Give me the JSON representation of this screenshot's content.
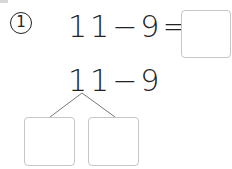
{
  "problem": {
    "number_label": "1",
    "equation": "11−9=",
    "decomposition_expression": "11−9",
    "answer_box_value": "",
    "split_left_value": "",
    "split_right_value": ""
  },
  "colors": {
    "text": "#222222",
    "box_border": "#c6c6c6",
    "branch_line": "#777777"
  }
}
